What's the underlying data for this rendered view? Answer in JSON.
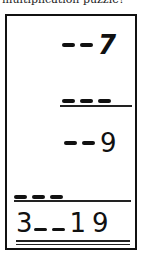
{
  "caption": "multiplication puzzle?",
  "puzzle": {
    "multiplicand": {
      "blanks": 2,
      "digit": "7"
    },
    "multiplier": {
      "blanks": 3,
      "digit": ""
    },
    "partial_product": {
      "blanks": 2,
      "digit": "9"
    },
    "partial_product_2": {
      "blanks": 3,
      "digit": ""
    },
    "result": {
      "prefix": "3",
      "blanks": 2,
      "suffix": "19"
    }
  }
}
